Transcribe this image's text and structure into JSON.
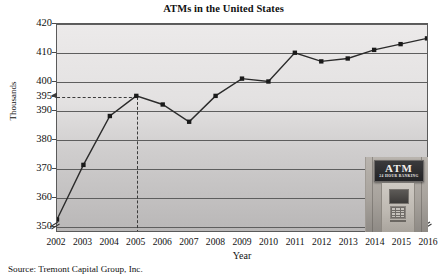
{
  "chart_data": {
    "type": "line",
    "title": "ATMs in the United States",
    "xlabel": "Year",
    "ylabel": "Thousands",
    "x": [
      2002,
      2003,
      2004,
      2005,
      2006,
      2007,
      2008,
      2009,
      2010,
      2011,
      2012,
      2013,
      2014,
      2015,
      2016
    ],
    "categories": [
      "2002",
      "2003",
      "2004",
      "2005",
      "2006",
      "2007",
      "2008",
      "2009",
      "2010",
      "2011",
      "2012",
      "2013",
      "2014",
      "2015",
      "2016"
    ],
    "values": [
      352,
      371,
      388,
      395,
      392,
      386,
      395,
      401,
      400,
      410,
      407,
      408,
      411,
      413,
      415
    ],
    "series": [
      {
        "name": "ATMs",
        "values": [
          352,
          371,
          388,
          395,
          392,
          386,
          395,
          401,
          400,
          410,
          407,
          408,
          411,
          413,
          415
        ]
      }
    ],
    "ylim": [
      348,
      420
    ],
    "xlim": [
      2002,
      2016
    ],
    "y_ticks": [
      350,
      360,
      370,
      380,
      390,
      395,
      400,
      410,
      420
    ],
    "y_tick_labels": [
      "350",
      "360",
      "370",
      "380",
      "390",
      "395",
      "400",
      "410",
      "420"
    ],
    "gridlines": [
      350,
      360,
      370,
      380,
      390,
      400,
      410,
      420
    ],
    "grid": true,
    "legend": "none",
    "axis_break": true,
    "annotations": {
      "reference_value": 395,
      "reference_year": "2005",
      "reference_style": "dashed"
    },
    "marker": "filled-square",
    "line_color": "#2b2b2b",
    "marker_color": "#1a1a1a"
  },
  "inset": {
    "name": "atm-photo",
    "sign_main": "ATM",
    "sign_sub": "24 HOUR BANKING"
  },
  "footer": {
    "source": "Source: Tremont Capital Group, Inc."
  },
  "colors": {
    "line": "#2b2b2b",
    "grid": "#5e5e5e",
    "frame": "#5a5a5a",
    "text": "#111111",
    "dashed": "#3b3b3b"
  }
}
